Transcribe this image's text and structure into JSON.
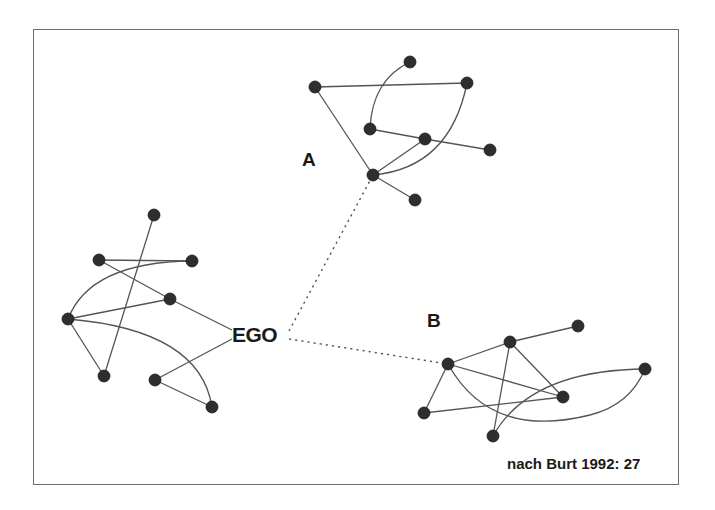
{
  "diagram": {
    "type": "social-network",
    "labels": {
      "cluster_a": "A",
      "cluster_b": "B",
      "ego": "EGO"
    },
    "citation": "nach Burt 1992: 27",
    "colors": {
      "node": "#2e2e2e",
      "edge": "#555555",
      "frame": "#6e6e6e"
    },
    "clusters": {
      "A": {
        "nodes": [
          [
            315,
            87
          ],
          [
            410,
            62
          ],
          [
            467,
            83
          ],
          [
            370,
            129
          ],
          [
            425,
            139
          ],
          [
            490,
            150
          ],
          [
            373,
            175
          ],
          [
            415,
            200
          ]
        ],
        "hub": [
          373,
          175
        ]
      },
      "B": {
        "nodes": [
          [
            448,
            364
          ],
          [
            510,
            342
          ],
          [
            578,
            326
          ],
          [
            645,
            369
          ],
          [
            563,
            397
          ],
          [
            424,
            413
          ],
          [
            493,
            436
          ]
        ],
        "hub": [
          448,
          364
        ]
      },
      "ego_network": {
        "nodes": [
          [
            154,
            215
          ],
          [
            99,
            260
          ],
          [
            192,
            261
          ],
          [
            170,
            299
          ],
          [
            68,
            319
          ],
          [
            104,
            376
          ],
          [
            155,
            380
          ],
          [
            212,
            407
          ]
        ]
      }
    },
    "bridges": [
      {
        "from": "EGO",
        "to": "A-hub",
        "style": "dotted"
      },
      {
        "from": "EGO",
        "to": "B-hub",
        "style": "dotted"
      }
    ]
  }
}
